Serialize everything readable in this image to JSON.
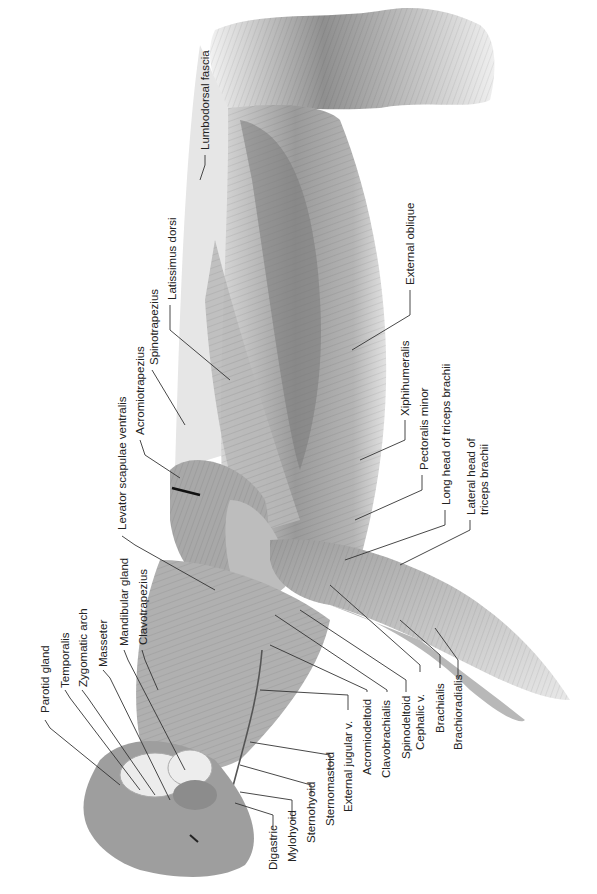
{
  "figure": {
    "palette": {
      "background": "#ffffff",
      "muscle_light": "#c9c9c9",
      "muscle_mid": "#a3a3a3",
      "muscle_dark": "#7d7d7d",
      "fascia": "#e4e4e4",
      "gland": "#e8e8e8",
      "label_text": "#222222",
      "leader_line": "#333333"
    }
  },
  "labels": {
    "lumbodorsal_fascia": "Lumbodorsal fascia",
    "external_oblique": "External oblique",
    "latissimus_dorsi": "Latissimus dorsi",
    "spinotrapezius": "Spinotrapezius",
    "acromiotrapezius": "Acromiotrapezius",
    "levator_scapulae_ventralis": "Levator scapulae ventralis",
    "xiphihumeralis": "Xiphihumeralis",
    "pectoralis_minor": "Pectoralis minor",
    "long_head_triceps": "Long head of triceps brachii",
    "lateral_head_triceps_1": "Lateral head of",
    "lateral_head_triceps_2": "triceps brachii",
    "parotid_gland": "Parotid gland",
    "temporalis": "Temporalis",
    "zygomatic_arch": "Zygomatic arch",
    "masseter": "Masseter",
    "mandibular_gland": "Mandibular gland",
    "clavotrapezius": "Clavotrapezius",
    "digastric": "Digastric",
    "mylohyoid": "Mylohyoid",
    "sternohyoid": "Sternohyoid",
    "sternomastoid": "Sternomastoid",
    "external_jugular_v": "External jugular v.",
    "acromiodeltoid": "Acromiodeltoid",
    "clavobrachialis": "Clavobrachialis",
    "spinodeltoid": "Spinodeltoid",
    "cephalic_v": "Cephalic v.",
    "brachialis": "Brachialis",
    "brachioradialis": "Brachioradialis"
  }
}
